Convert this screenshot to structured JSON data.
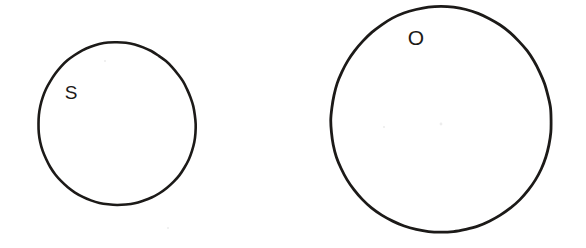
{
  "figure": {
    "background_color": "#ffffff",
    "stroke_color": "#1c1a18",
    "width": 586,
    "height": 248,
    "shapes": [
      {
        "id": "small-circle",
        "label": "S",
        "shape": "circle",
        "center_x": 117,
        "center_y": 124,
        "radius_x": 79,
        "radius_y": 81,
        "stroke_width": 2.6,
        "label_x": 71,
        "label_y": 94
      },
      {
        "id": "large-circle",
        "label": "O",
        "shape": "circle",
        "center_x": 441,
        "center_y": 120,
        "radius_x": 111,
        "radius_y": 112,
        "stroke_width": 2.8,
        "label_x": 416,
        "label_y": 39
      }
    ]
  }
}
